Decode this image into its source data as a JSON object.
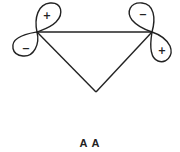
{
  "diagram": {
    "type": "molecular-orbital",
    "label": "A A",
    "left_orbital": {
      "upper_lobe_sign": "+",
      "lower_lobe_sign": "−"
    },
    "right_orbital": {
      "upper_lobe_sign": "−",
      "lower_lobe_sign": "+"
    },
    "colors": {
      "line": "#222222",
      "background": "#ffffff"
    }
  }
}
